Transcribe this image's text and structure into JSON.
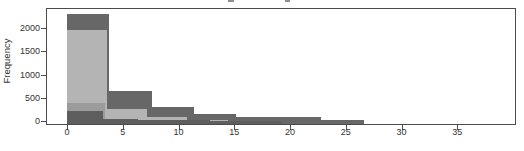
{
  "chart_data": {
    "type": "bar",
    "subtype": "overlaid-histograms",
    "title": "",
    "title_cropped_fragments_visible": true,
    "xlabel": "",
    "ylabel": "Frequency",
    "x_ticks": [
      0,
      5,
      10,
      15,
      20,
      25,
      30,
      35
    ],
    "y_ticks": [
      0,
      500,
      1000,
      1500,
      2000
    ],
    "xlim": [
      -1.9,
      40.3
    ],
    "ylim": [
      0,
      2420
    ],
    "grid": false,
    "legend": null,
    "frame_box": true,
    "series": [
      {
        "name": "histogram-dark-wide",
        "color": "#676767",
        "bin_start": 0,
        "bin_width": 3.8,
        "counts": [
          2300,
          650,
          310,
          155,
          85,
          85,
          40,
          0,
          0,
          0
        ]
      },
      {
        "name": "histogram-light",
        "color": "#b4b4b4",
        "bin_start": 0,
        "bin_width": 3.6,
        "counts": [
          1950,
          260,
          90,
          30,
          0,
          0,
          0,
          0,
          0,
          0
        ]
      },
      {
        "name": "histogram-medium",
        "color": "#9b9b9b",
        "bin_start": 0,
        "bin_width": 3.4,
        "counts": [
          400,
          0,
          0,
          0,
          0,
          0,
          0,
          0,
          0,
          0
        ]
      },
      {
        "name": "histogram-dark-narrow",
        "color": "#5e5e5e",
        "bin_start": 0,
        "bin_width": 3.2,
        "counts": [
          230,
          60,
          40,
          25,
          15,
          8,
          0,
          0,
          0,
          0
        ]
      }
    ]
  },
  "colors": {
    "background": "#ffffff",
    "frame": "#4c4c4c",
    "text": "#333333",
    "title_fragment": "#8f8f8f"
  }
}
